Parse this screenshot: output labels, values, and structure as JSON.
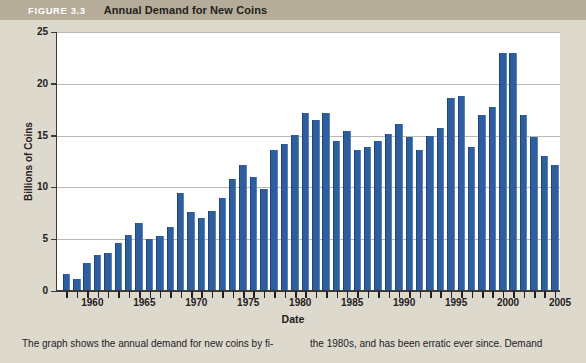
{
  "figure": {
    "number": "FIGURE 3.3",
    "title": "Annual Demand for New Coins"
  },
  "caption": {
    "left": "The graph shows the annual demand for new coins by fi-",
    "right": "the 1980s, and has been erratic ever since. Demand"
  },
  "colors": {
    "bar": "#2f5e9e",
    "header_band": "#b5ad9a",
    "page_background": "#ddd9cd",
    "plot_background": "#ffffff",
    "gridline": "#b9b7b2",
    "axis": "#3c3a36"
  },
  "chart_data": {
    "type": "bar",
    "title": "Annual Demand for New Coins",
    "xlabel": "Date",
    "ylabel": "Billions of Coins",
    "ylim": [
      0,
      25
    ],
    "yticks": [
      0,
      5,
      10,
      15,
      20,
      25
    ],
    "xticks": [
      1960,
      1965,
      1970,
      1975,
      1980,
      1985,
      1990,
      1995,
      2000,
      2005
    ],
    "xlim": [
      1956.5,
      2005
    ],
    "grid": true,
    "legend": null,
    "categories": [
      1957,
      1958,
      1959,
      1960,
      1961,
      1962,
      1963,
      1964,
      1965,
      1966,
      1967,
      1968,
      1969,
      1970,
      1971,
      1972,
      1973,
      1974,
      1975,
      1976,
      1977,
      1978,
      1979,
      1980,
      1981,
      1982,
      1983,
      1984,
      1985,
      1986,
      1987,
      1988,
      1989,
      1990,
      1991,
      1992,
      1993,
      1994,
      1995,
      1996,
      1997,
      1998,
      1999,
      2000,
      2001,
      2002,
      2003,
      2004
    ],
    "values": [
      1.6,
      1.2,
      2.7,
      3.5,
      3.7,
      4.6,
      5.4,
      6.6,
      5.0,
      5.3,
      6.2,
      9.5,
      7.6,
      7.0,
      7.7,
      9.0,
      10.8,
      12.2,
      11.0,
      9.8,
      13.6,
      14.2,
      15.1,
      17.2,
      16.5,
      17.2,
      14.5,
      15.4,
      13.6,
      13.9,
      14.5,
      15.2,
      16.1,
      14.9,
      13.6,
      15.0,
      15.7,
      18.6,
      18.8,
      13.9,
      17.0,
      17.8,
      23.0,
      23.0,
      17.0,
      14.9,
      13.0,
      12.2
    ]
  }
}
